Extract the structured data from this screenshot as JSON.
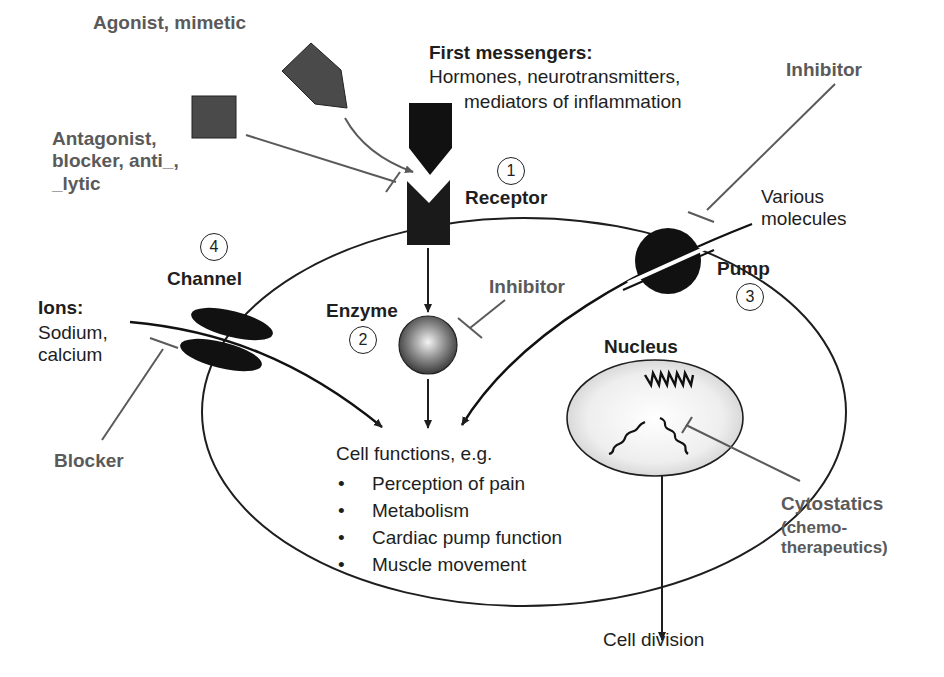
{
  "labels": {
    "agonist": "Agonist, mimetic",
    "antagonist": [
      "Antagonist,",
      "blocker,  anti_,",
      "_lytic"
    ],
    "first_messengers_title": "First messengers:",
    "first_messengers_line1": "Hormones, neurotransmitters,",
    "first_messengers_line2": "mediators of inflammation",
    "inhibitor_pump": "Inhibitor",
    "various_molecules": [
      "Various",
      "molecules"
    ],
    "receptor": "Receptor",
    "channel": "Channel",
    "ions_title": "Ions:",
    "ions_list": [
      "Sodium,",
      "calcium"
    ],
    "enzyme": "Enzyme",
    "inhibitor_enzyme": "Inhibitor",
    "pump": "Pump",
    "nucleus": "Nucleus",
    "blocker": "Blocker",
    "cytostatics_title": "Cytostatics",
    "cytostatics_sub": [
      "(chemo-",
      "therapeutics)"
    ],
    "cell_functions_title": "Cell functions, e.g.",
    "cell_functions": [
      "Perception of pain",
      "Metabolism",
      "Cardiac pump function",
      "Muscle movement"
    ],
    "cell_division": "Cell division"
  },
  "target_numbers": {
    "receptor": "1",
    "enzyme": "2",
    "pump": "3",
    "channel": "4"
  },
  "colors": {
    "ink": "#1e1e1e",
    "gray_line": "#5a5a5a",
    "ligand_fill": "#4a4a4a"
  }
}
